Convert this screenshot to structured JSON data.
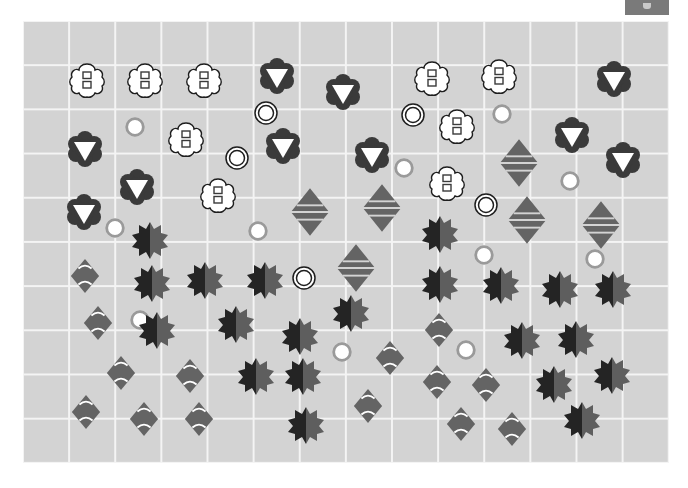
{
  "colors": {
    "board": "#d3d3d3",
    "grid_line": "#f4f4f4",
    "dark_piece": "#3a3a3a",
    "mid_piece": "#646464",
    "starburst_dark": "#242424",
    "starburst_light": "#5e5e5e",
    "ring_gray": "#9a9a9a",
    "white": "#ffffff",
    "corner_button": "#7a7a7a"
  },
  "board": {
    "columns": 14,
    "rows": 10
  },
  "pieces": {
    "flower_squares": [
      [
        87,
        80
      ],
      [
        145,
        80
      ],
      [
        204,
        80
      ],
      [
        432,
        78
      ],
      [
        499,
        76
      ],
      [
        186,
        139
      ],
      [
        457,
        126
      ],
      [
        218,
        195
      ],
      [
        447,
        183
      ]
    ],
    "dark_triangle_badge": [
      [
        277,
        76
      ],
      [
        343,
        92
      ],
      [
        614,
        79
      ],
      [
        85,
        149
      ],
      [
        283,
        146
      ],
      [
        372,
        155
      ],
      [
        572,
        135
      ],
      [
        623,
        160
      ],
      [
        137,
        187
      ],
      [
        84,
        212
      ]
    ],
    "double_ring": [
      [
        266,
        113
      ],
      [
        237,
        158
      ],
      [
        413,
        115
      ],
      [
        486,
        205
      ],
      [
        304,
        278
      ]
    ],
    "gray_ring": [
      [
        135,
        127
      ],
      [
        115,
        228
      ],
      [
        258,
        231
      ],
      [
        404,
        168
      ],
      [
        502,
        114
      ],
      [
        570,
        181
      ],
      [
        484,
        255
      ],
      [
        595,
        259
      ],
      [
        140,
        320
      ],
      [
        342,
        352
      ],
      [
        466,
        350
      ]
    ],
    "striped_diamond": [
      [
        310,
        212
      ],
      [
        382,
        208
      ],
      [
        519,
        163
      ],
      [
        527,
        220
      ],
      [
        601,
        225
      ],
      [
        356,
        268
      ]
    ],
    "split_starburst": [
      [
        150,
        240
      ],
      [
        152,
        283
      ],
      [
        205,
        280
      ],
      [
        265,
        280
      ],
      [
        440,
        234
      ],
      [
        157,
        330
      ],
      [
        236,
        324
      ],
      [
        300,
        336
      ],
      [
        351,
        313
      ],
      [
        440,
        284
      ],
      [
        501,
        285
      ],
      [
        560,
        289
      ],
      [
        613,
        289
      ],
      [
        522,
        340
      ],
      [
        576,
        339
      ],
      [
        256,
        376
      ],
      [
        303,
        376
      ],
      [
        554,
        384
      ],
      [
        612,
        375
      ],
      [
        306,
        425
      ],
      [
        582,
        420
      ]
    ],
    "arc_diamond": [
      [
        85,
        276
      ],
      [
        98,
        323
      ],
      [
        121,
        373
      ],
      [
        190,
        376
      ],
      [
        86,
        412
      ],
      [
        144,
        419
      ],
      [
        199,
        419
      ],
      [
        390,
        358
      ],
      [
        439,
        330
      ],
      [
        437,
        382
      ],
      [
        486,
        385
      ],
      [
        368,
        406
      ],
      [
        461,
        424
      ],
      [
        512,
        429
      ]
    ]
  }
}
